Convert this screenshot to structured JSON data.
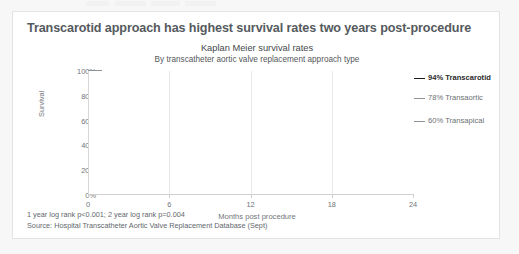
{
  "card": {
    "headline": "Transcarotid approach has highest survival rates two years post-procedure",
    "footnote_1": "1 year log rank p<0.001; 2 year log rank p=0.004",
    "footnote_2": "Source: Hospital Transcatheter Aortic Valve Replacement Database (Sept)"
  },
  "chart_data": {
    "type": "line",
    "title": "Kaplan Meier survival rates",
    "subtitle": "By transcatheter aortic valve replacement approach type",
    "xlabel": "Months post procedure",
    "ylabel": "Survival",
    "xlim": [
      0,
      24
    ],
    "ylim": [
      0,
      1
    ],
    "xticks": [
      0,
      6,
      12,
      18,
      24
    ],
    "xtick_labels": [
      "0",
      "6",
      "12",
      "18",
      "24"
    ],
    "yticks": [
      0,
      0.2,
      0.4,
      0.6,
      0.8,
      1.0
    ],
    "ytick_labels": [
      "0%",
      "20%",
      "40%",
      "60%",
      "80%",
      "100%"
    ],
    "grid": "vertical-only",
    "legend": "right-end-labels",
    "step": "post",
    "series": [
      {
        "name": "Transcarotid",
        "end_label": "94% Transcarotid",
        "end_value": 0.94,
        "color": "#1a1a1a",
        "width": 1.9,
        "points": [
          [
            0,
            1.0
          ],
          [
            0.7,
            1.0
          ],
          [
            0.7,
            0.995
          ],
          [
            4.3,
            0.995
          ],
          [
            4.3,
            0.99
          ],
          [
            11.0,
            0.99
          ],
          [
            11.0,
            0.975
          ],
          [
            14.2,
            0.975
          ],
          [
            14.2,
            0.968
          ],
          [
            18.3,
            0.968
          ],
          [
            18.3,
            0.952
          ],
          [
            20.0,
            0.952
          ],
          [
            20.0,
            0.944
          ],
          [
            24,
            0.944
          ]
        ]
      },
      {
        "name": "Transaortic",
        "end_label": "78% Transaortic",
        "end_value": 0.78,
        "color": "#8d9297",
        "width": 1.2,
        "points": [
          [
            0,
            1.0
          ],
          [
            1.0,
            1.0
          ],
          [
            1.0,
            0.955
          ],
          [
            2.3,
            0.955
          ],
          [
            2.3,
            0.935
          ],
          [
            3.2,
            0.935
          ],
          [
            3.2,
            0.895
          ],
          [
            9.5,
            0.895
          ],
          [
            9.5,
            0.862
          ],
          [
            12.3,
            0.862
          ],
          [
            12.3,
            0.838
          ],
          [
            20.3,
            0.838
          ],
          [
            20.3,
            0.79
          ],
          [
            24,
            0.79
          ]
        ]
      },
      {
        "name": "Transapical",
        "end_label": "60% Transapical",
        "end_value": 0.6,
        "color": "#8d9297",
        "width": 1.2,
        "points": [
          [
            0,
            1.0
          ],
          [
            1.0,
            1.0
          ],
          [
            1.0,
            0.955
          ],
          [
            2.3,
            0.955
          ],
          [
            2.3,
            0.86
          ],
          [
            3.2,
            0.86
          ],
          [
            3.2,
            0.8
          ],
          [
            5.1,
            0.8
          ],
          [
            5.1,
            0.755
          ],
          [
            8.6,
            0.755
          ],
          [
            8.6,
            0.735
          ],
          [
            11.9,
            0.735
          ],
          [
            11.9,
            0.695
          ],
          [
            18.7,
            0.695
          ],
          [
            18.7,
            0.635
          ],
          [
            24,
            0.635
          ]
        ]
      }
    ]
  }
}
